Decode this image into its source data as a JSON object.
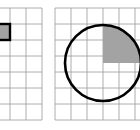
{
  "figure": {
    "title": "Two square grids: left grid with one highlighted unit cell, right grid with an inscribed circle and a shaded quarter sector",
    "canvas": {
      "width": 140,
      "height": 130,
      "background": "#ffffff"
    },
    "colors": {
      "grid_line": "#9a9a9a",
      "shade_fill": "#a3a3a3",
      "outline_stroke": "#000000",
      "background": "#ffffff"
    },
    "panels": [
      {
        "id": "left-panel",
        "name": "unit-cell-panel",
        "label": "left grid",
        "grid": {
          "cell_size": 16,
          "origin_x": -22,
          "origin_y": 8,
          "columns": 4,
          "rows": 7,
          "clip_x": 0,
          "clip_y": 0,
          "clip_width": 44,
          "clip_height": 130,
          "line_width": 0.8
        },
        "highlight_cell": {
          "name": "highlighted-unit-cell",
          "column_index": 1,
          "row_index": 1,
          "x": -6,
          "y": 24,
          "width": 16,
          "height": 16,
          "fill": "#a3a3a3",
          "stroke": "#000000",
          "stroke_width": 2.4
        }
      },
      {
        "id": "right-panel",
        "name": "circle-panel",
        "label": "right grid",
        "grid": {
          "cell_size": 16,
          "origin_x": 55,
          "origin_y": 8,
          "columns": 6,
          "rows": 7,
          "clip_x": 48,
          "clip_y": 0,
          "clip_width": 92,
          "clip_height": 130,
          "line_width": 0.8
        },
        "circle": {
          "name": "inscribed-circle",
          "center_x": 103,
          "center_y": 63,
          "radius": 38,
          "stroke": "#000000",
          "stroke_width": 2.6,
          "fill": "none"
        },
        "shaded_sector": {
          "name": "shaded-quarter-sector",
          "description": "upper-right quadrant of the circle, filled gray",
          "quadrant": "upper-right",
          "center_x": 103,
          "center_y": 63,
          "radius": 38,
          "start_angle_deg": 0,
          "end_angle_deg": 90,
          "fill": "#a3a3a3"
        }
      }
    ]
  }
}
